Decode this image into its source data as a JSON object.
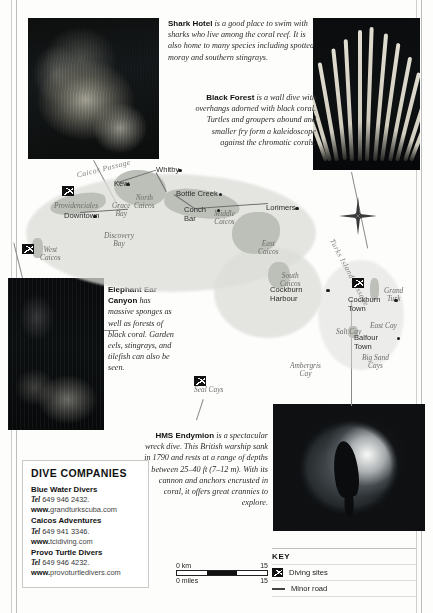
{
  "captions": [
    {
      "id": "shark-hotel",
      "title": "Shark Hotel",
      "text": " is a good place to swim with sharks who live among the coral reef. It is also home to many species including spotted moray and southern stingrays."
    },
    {
      "id": "black-forest",
      "title": "Black Forest",
      "text": " is a wall dive with overhangs adorned with black coral. Turtles and groupers abound and smaller fry form a kaleidoscope against the chromatic corals."
    },
    {
      "id": "elephant-ear-canyon",
      "title": "Elephant Ear Canyon",
      "text": " has massive sponges as well as forests of black coral. Garden eels, stingrays, and tilefish can also be seen."
    },
    {
      "id": "hms-endymion",
      "title": "HMS Endymion",
      "text": " is a spectacular wreck dive. This British warship sank in 1790 and rests at a range of depths between 25–40 ft (7–12 m). With its cannon and anchors encrusted in coral, it offers great crannies to explore."
    }
  ],
  "map": {
    "islands": [
      {
        "label": "Providenciales",
        "x": 36,
        "y": 52
      },
      {
        "label": "West\nCaicos",
        "x": 22,
        "y": 96
      },
      {
        "label": "North\nCaicos",
        "x": 116,
        "y": 44
      },
      {
        "label": "Middle\nCaicos",
        "x": 196,
        "y": 60
      },
      {
        "label": "East\nCaicos",
        "x": 240,
        "y": 90
      },
      {
        "label": "South\nCaicos",
        "x": 262,
        "y": 122
      },
      {
        "label": "Grand\nTurk",
        "x": 366,
        "y": 137
      },
      {
        "label": "East Cay",
        "x": 352,
        "y": 172
      },
      {
        "label": "Salt Cay",
        "x": 318,
        "y": 178
      },
      {
        "label": "Ambergris\nCay",
        "x": 272,
        "y": 212
      },
      {
        "label": "Seal Cays",
        "x": 176,
        "y": 236
      },
      {
        "label": "Big Sand\nCays",
        "x": 344,
        "y": 204
      },
      {
        "label": "Grace\nBay",
        "x": 94,
        "y": 52
      },
      {
        "label": "Discovery\nBay",
        "x": 86,
        "y": 82
      }
    ],
    "towns": [
      {
        "label": "Whitby",
        "x": 138,
        "y": 16
      },
      {
        "label": "Kew",
        "x": 96,
        "y": 30
      },
      {
        "label": "Bottle Creek",
        "x": 158,
        "y": 40
      },
      {
        "label": "Conch\nBar",
        "x": 166,
        "y": 56
      },
      {
        "label": "Lorimers",
        "x": 248,
        "y": 54
      },
      {
        "label": "Downtown",
        "x": 46,
        "y": 62
      },
      {
        "label": "Cockburn\nHarbour",
        "x": 252,
        "y": 136
      },
      {
        "label": "Cockburn\nTown",
        "x": 330,
        "y": 146
      },
      {
        "label": "Balfour\nTown",
        "x": 336,
        "y": 184
      }
    ],
    "passages": [
      {
        "label": "Caicos  Passage",
        "x": 58,
        "y": 14,
        "rot": -14
      },
      {
        "label": "Turks Island Passage",
        "x": 294,
        "y": 118,
        "rot": 62
      }
    ],
    "dive_sites": [
      {
        "name": "shark-hotel-site",
        "x": 44,
        "y": 36
      },
      {
        "name": "west-caicos-site",
        "x": 4,
        "y": 94
      },
      {
        "name": "elephant-ear-site",
        "x": 176,
        "y": 226
      },
      {
        "name": "hms-endymion-site",
        "x": 334,
        "y": 128
      }
    ]
  },
  "dive_companies": {
    "heading": "DIVE COMPANIES",
    "items": [
      {
        "name": "Blue Water Divers",
        "tel_label": "Tel",
        "tel": "649 946 2432.",
        "www_label": "www.",
        "web": "grandturkscuba.com"
      },
      {
        "name": "Caicos Adventures",
        "tel_label": "Tel",
        "tel": "649 941 3346.",
        "www_label": "www.",
        "web": "tcidiving.com"
      },
      {
        "name": "Provo Turtle Divers",
        "tel_label": "Tel",
        "tel": "649 946 4232.",
        "www_label": "www.",
        "web": "provoturtledivers.com"
      }
    ]
  },
  "scale": {
    "km_label": "0 km",
    "km_value": "15",
    "miles_label": "0 miles",
    "miles_value": "15"
  },
  "key": {
    "heading": "KEY",
    "items": [
      {
        "icon": "diving-site-icon",
        "label": "Diving sites"
      },
      {
        "icon": "minor-road-icon",
        "label": "Minor road"
      }
    ]
  }
}
